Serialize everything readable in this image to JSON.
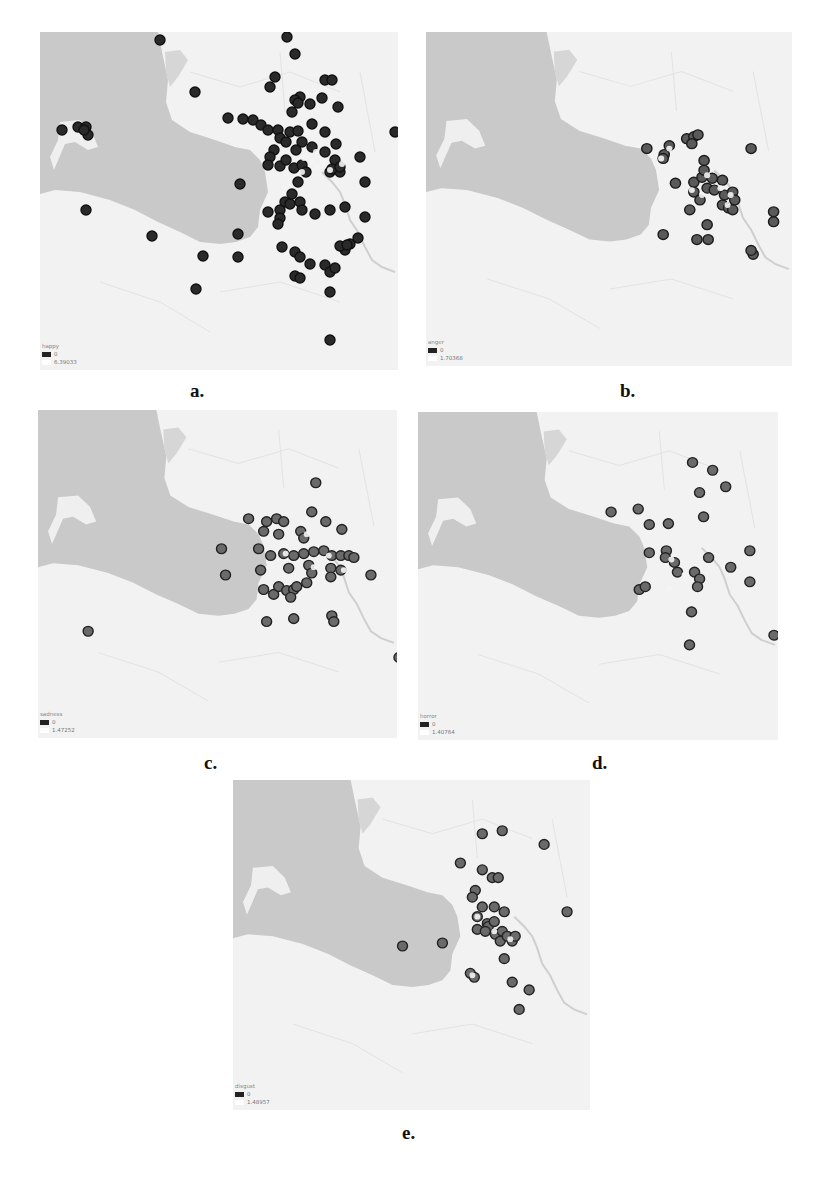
{
  "figure": {
    "panels": [
      {
        "id": "a",
        "caption": "a.",
        "legend": {
          "title": "happy",
          "min": "0",
          "max": "6.39033"
        },
        "point_color": "#2a2a2a",
        "point_ring": "#111111",
        "points": [
          [
            120,
            8
          ],
          [
            155,
            60
          ],
          [
            22,
            98
          ],
          [
            38,
            95
          ],
          [
            46,
            95
          ],
          [
            48,
            103
          ],
          [
            44,
            98
          ],
          [
            46,
            178
          ],
          [
            112,
            204
          ],
          [
            163,
            224
          ],
          [
            156,
            257
          ],
          [
            198,
            202
          ],
          [
            198,
            225
          ],
          [
            247,
            5
          ],
          [
            255,
            22
          ],
          [
            235,
            45
          ],
          [
            230,
            55
          ],
          [
            285,
            48
          ],
          [
            292,
            48
          ],
          [
            260,
            65
          ],
          [
            255,
            68
          ],
          [
            270,
            72
          ],
          [
            282,
            66
          ],
          [
            298,
            75
          ],
          [
            272,
            92
          ],
          [
            252,
            80
          ],
          [
            258,
            71
          ],
          [
            188,
            86
          ],
          [
            203,
            87
          ],
          [
            213,
            88
          ],
          [
            221,
            93
          ],
          [
            228,
            98
          ],
          [
            238,
            98
          ],
          [
            240,
            106
          ],
          [
            246,
            110
          ],
          [
            250,
            100
          ],
          [
            258,
            99
          ],
          [
            262,
            110
          ],
          [
            256,
            118
          ],
          [
            234,
            118
          ],
          [
            230,
            125
          ],
          [
            228,
            133
          ],
          [
            240,
            134
          ],
          [
            246,
            128
          ],
          [
            254,
            136
          ],
          [
            262,
            133
          ],
          [
            266,
            140
          ],
          [
            258,
            150
          ],
          [
            252,
            162
          ],
          [
            245,
            170
          ],
          [
            240,
            178
          ],
          [
            240,
            186
          ],
          [
            238,
            192
          ],
          [
            228,
            180
          ],
          [
            285,
            100
          ],
          [
            272,
            115
          ],
          [
            285,
            120
          ],
          [
            295,
            128
          ],
          [
            300,
            140
          ],
          [
            290,
            140
          ],
          [
            296,
            112
          ],
          [
            320,
            125
          ],
          [
            325,
            150
          ],
          [
            200,
            152
          ],
          [
            250,
            172
          ],
          [
            260,
            170
          ],
          [
            262,
            178
          ],
          [
            275,
            182
          ],
          [
            290,
            178
          ],
          [
            305,
            175
          ],
          [
            292,
            137
          ],
          [
            300,
            135
          ],
          [
            355,
            100
          ],
          [
            325,
            185
          ],
          [
            242,
            215
          ],
          [
            255,
            220
          ],
          [
            260,
            225
          ],
          [
            270,
            232
          ],
          [
            285,
            233
          ],
          [
            290,
            240
          ],
          [
            295,
            236
          ],
          [
            305,
            218
          ],
          [
            300,
            214
          ],
          [
            310,
            212
          ],
          [
            318,
            206
          ],
          [
            307,
            213
          ],
          [
            255,
            244
          ],
          [
            260,
            246
          ],
          [
            290,
            260
          ],
          [
            290,
            308
          ]
        ],
        "hot_points": [
          [
            264,
            126
          ],
          [
            271,
            130
          ],
          [
            277,
            135
          ],
          [
            283,
            130
          ],
          [
            276,
            120
          ],
          [
            290,
            138
          ],
          [
            302,
            132
          ],
          [
            262,
            140
          ],
          [
            268,
            100
          ]
        ]
      },
      {
        "id": "b",
        "caption": "b.",
        "legend": {
          "title": "anger",
          "min": "0",
          "max": "1.70368"
        },
        "point_color": "#5a5a5a",
        "point_ring": "#1c1c1c",
        "points": [
          [
            216,
            118
          ],
          [
            238,
            115
          ],
          [
            233,
            124
          ],
          [
            232,
            128
          ],
          [
            255,
            108
          ],
          [
            262,
            106
          ],
          [
            266,
            104
          ],
          [
            260,
            113
          ],
          [
            318,
            118
          ],
          [
            272,
            130
          ],
          [
            244,
            153
          ],
          [
            262,
            152
          ],
          [
            270,
            147
          ],
          [
            272,
            140
          ],
          [
            280,
            148
          ],
          [
            290,
            150
          ],
          [
            262,
            162
          ],
          [
            275,
            158
          ],
          [
            268,
            170
          ],
          [
            282,
            160
          ],
          [
            292,
            165
          ],
          [
            300,
            162
          ],
          [
            290,
            175
          ],
          [
            296,
            178
          ],
          [
            302,
            170
          ],
          [
            300,
            180
          ],
          [
            258,
            180
          ],
          [
            275,
            195
          ],
          [
            232,
            205
          ],
          [
            265,
            210
          ],
          [
            276,
            210
          ],
          [
            320,
            225
          ],
          [
            318,
            221
          ],
          [
            340,
            182
          ],
          [
            340,
            192
          ]
        ],
        "hot_points": [
          [
            238,
            118
          ],
          [
            230,
            128
          ],
          [
            275,
            145
          ],
          [
            260,
            160
          ],
          [
            288,
            158
          ],
          [
            298,
            165
          ],
          [
            270,
            165
          ],
          [
            295,
            175
          ]
        ]
      },
      {
        "id": "c",
        "caption": "c.",
        "legend": {
          "title": "sadness",
          "min": "0",
          "max": "1.47252"
        },
        "point_color": "#6a6a6a",
        "point_ring": "#222222",
        "points": [
          [
            277,
            75
          ],
          [
            273,
            105
          ],
          [
            287,
            115
          ],
          [
            303,
            123
          ],
          [
            210,
            112
          ],
          [
            228,
            115
          ],
          [
            238,
            112
          ],
          [
            245,
            115
          ],
          [
            225,
            125
          ],
          [
            240,
            128
          ],
          [
            262,
            125
          ],
          [
            265,
            132
          ],
          [
            183,
            143
          ],
          [
            220,
            143
          ],
          [
            232,
            150
          ],
          [
            245,
            148
          ],
          [
            255,
            150
          ],
          [
            265,
            148
          ],
          [
            275,
            146
          ],
          [
            285,
            145
          ],
          [
            293,
            150
          ],
          [
            302,
            150
          ],
          [
            310,
            150
          ],
          [
            315,
            152
          ],
          [
            222,
            165
          ],
          [
            250,
            163
          ],
          [
            270,
            160
          ],
          [
            273,
            168
          ],
          [
            292,
            163
          ],
          [
            292,
            172
          ],
          [
            302,
            165
          ],
          [
            268,
            178
          ],
          [
            187,
            170
          ],
          [
            332,
            170
          ],
          [
            225,
            185
          ],
          [
            235,
            190
          ],
          [
            240,
            182
          ],
          [
            248,
            186
          ],
          [
            255,
            185
          ],
          [
            252,
            193
          ],
          [
            258,
            182
          ],
          [
            228,
            218
          ],
          [
            255,
            215
          ],
          [
            293,
            212
          ],
          [
            295,
            218
          ],
          [
            50,
            228
          ],
          [
            360,
            255
          ]
        ],
        "hot_points": [
          [
            247,
            148
          ],
          [
            268,
            128
          ],
          [
            275,
            162
          ],
          [
            305,
            165
          ],
          [
            290,
            150
          ]
        ]
      },
      {
        "id": "d",
        "caption": "d.",
        "legend": {
          "title": "horror",
          "min": "0",
          "max": "1.40764"
        },
        "point_color": "#6a6a6a",
        "point_ring": "#222222",
        "points": [
          [
            273,
            52
          ],
          [
            293,
            60
          ],
          [
            306,
            77
          ],
          [
            280,
            83
          ],
          [
            192,
            103
          ],
          [
            219,
            100
          ],
          [
            230,
            116
          ],
          [
            249,
            115
          ],
          [
            284,
            108
          ],
          [
            230,
            145
          ],
          [
            247,
            143
          ],
          [
            246,
            150
          ],
          [
            255,
            155
          ],
          [
            258,
            165
          ],
          [
            275,
            165
          ],
          [
            280,
            172
          ],
          [
            278,
            180
          ],
          [
            289,
            150
          ],
          [
            311,
            160
          ],
          [
            330,
            143
          ],
          [
            330,
            175
          ],
          [
            220,
            183
          ],
          [
            226,
            180
          ],
          [
            272,
            206
          ],
          [
            270,
            240
          ],
          [
            354,
            230
          ]
        ],
        "hot_points": [
          [
            252,
            152
          ],
          [
            265,
            168
          ],
          [
            250,
            182
          ]
        ]
      },
      {
        "id": "e",
        "caption": "e.",
        "legend": {
          "title": "disgust",
          "min": "0",
          "max": "1.48957"
        },
        "point_color": "#6a6a6a",
        "point_ring": "#222222",
        "points": [
          [
            250,
            55
          ],
          [
            270,
            52
          ],
          [
            312,
            66
          ],
          [
            228,
            85
          ],
          [
            250,
            92
          ],
          [
            260,
            100
          ],
          [
            266,
            100
          ],
          [
            243,
            113
          ],
          [
            240,
            120
          ],
          [
            250,
            130
          ],
          [
            262,
            130
          ],
          [
            272,
            135
          ],
          [
            245,
            140
          ],
          [
            255,
            147
          ],
          [
            256,
            150
          ],
          [
            262,
            145
          ],
          [
            245,
            153
          ],
          [
            253,
            155
          ],
          [
            263,
            158
          ],
          [
            270,
            155
          ],
          [
            268,
            165
          ],
          [
            275,
            160
          ],
          [
            280,
            165
          ],
          [
            283,
            160
          ],
          [
            335,
            135
          ],
          [
            170,
            170
          ],
          [
            210,
            167
          ],
          [
            272,
            183
          ],
          [
            238,
            198
          ],
          [
            242,
            202
          ],
          [
            280,
            207
          ],
          [
            297,
            215
          ],
          [
            287,
            235
          ]
        ],
        "hot_points": [
          [
            262,
            155
          ],
          [
            278,
            163
          ],
          [
            240,
            200
          ],
          [
            245,
            140
          ]
        ]
      }
    ]
  }
}
